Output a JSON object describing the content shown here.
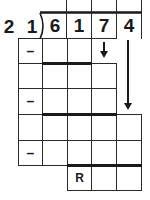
{
  "divisor": [
    "2",
    "1"
  ],
  "dividend": [
    "6",
    "1",
    "7",
    "4"
  ],
  "quotient_cells": [
    "",
    "",
    ""
  ],
  "rows": [
    {
      "row": 2,
      "labels": [
        "–",
        "",
        "",
        "↓"
      ]
    },
    {
      "row": 3,
      "labels": [
        "",
        "",
        "",
        ""
      ]
    },
    {
      "row": 4,
      "labels": [
        "–",
        "",
        "",
        ""
      ]
    },
    {
      "row": 5,
      "labels": [
        "",
        "",
        "",
        "",
        ""
      ]
    },
    {
      "row": 6,
      "labels": [
        "–",
        "",
        "",
        "",
        ""
      ]
    },
    {
      "row": 7,
      "labels": [
        "R",
        "",
        ""
      ]
    }
  ],
  "symbols": {
    "minus": "–",
    "remainder": "R"
  },
  "arrows": [
    {
      "name": "bring-down-7",
      "direction": "down"
    },
    {
      "name": "bring-down-4",
      "direction": "down"
    }
  ],
  "colors": {
    "line": "#1a1a1a",
    "background": "#ffffff"
  }
}
